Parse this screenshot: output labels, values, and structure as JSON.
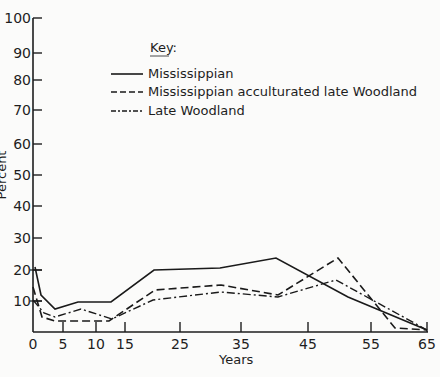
{
  "chart_data": {
    "type": "line",
    "title": "",
    "xlabel": "Years",
    "ylabel": "Percent",
    "ylim": [
      0,
      100
    ],
    "xlim": [
      0,
      65
    ],
    "grid": false,
    "legend_position": "upper-center",
    "legend_title": "Key:",
    "x_ticks": [
      0,
      5,
      10,
      15,
      25,
      35,
      45,
      55,
      65
    ],
    "y_ticks": [
      10,
      20,
      30,
      40,
      50,
      60,
      70,
      80,
      90,
      100
    ],
    "series": [
      {
        "name": "Mississippian",
        "style": "solid",
        "points": [
          [
            0.3,
            21.5
          ],
          [
            1.5,
            12
          ],
          [
            4,
            8
          ],
          [
            8,
            10
          ],
          [
            12.5,
            10
          ],
          [
            20,
            20
          ],
          [
            31,
            20.5
          ],
          [
            40,
            24
          ],
          [
            50,
            14
          ],
          [
            65,
            0.5
          ]
        ]
      },
      {
        "name": "Mississippian acculturated late Woodland",
        "style": "dashed",
        "points": [
          [
            0,
            15
          ],
          [
            1.5,
            5
          ],
          [
            4,
            4
          ],
          [
            10,
            4
          ],
          [
            12.5,
            4
          ],
          [
            20,
            15
          ],
          [
            31,
            17
          ],
          [
            40,
            14
          ],
          [
            49,
            24
          ],
          [
            61,
            2
          ],
          [
            65,
            0.5
          ]
        ]
      },
      {
        "name": "Late Woodland",
        "style": "dash-dot",
        "points": [
          [
            0,
            10.5
          ],
          [
            2,
            6
          ],
          [
            4,
            5
          ],
          [
            8,
            8
          ],
          [
            12.5,
            6
          ],
          [
            20,
            12
          ],
          [
            31,
            14
          ],
          [
            40,
            12.5
          ],
          [
            49,
            17.5
          ],
          [
            65,
            0.5
          ]
        ]
      }
    ]
  },
  "axis_pixels": {
    "x_tick_px": {
      "0": 33,
      "5": 63,
      "10": 96,
      "15": 125,
      "25": 180,
      "35": 241,
      "45": 308,
      "55": 371,
      "65": 427
    },
    "y_tick_px": {
      "0": 332,
      "10": 301,
      "20": 270,
      "30": 238,
      "40": 206,
      "50": 175,
      "60": 144,
      "70": 110,
      "80": 80,
      "90": 53,
      "100": 18
    }
  },
  "series_pixels": [
    "35,267 41,295 55,309 78,302 111,302 154,270 220,268 276,258 348,297 427,330",
    "33,287 42,317 55,321 96,321 109,321 155,290 221,285 278,295 338,258 395,328 427,330",
    "33,300 44,313 55,317 81,309 112,319 153,300 221,292 278,297 336,280 427,330"
  ]
}
